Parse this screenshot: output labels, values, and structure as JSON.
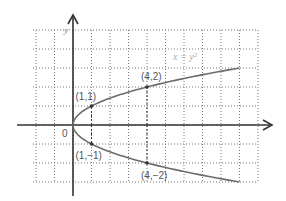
{
  "chart_data": {
    "type": "line",
    "title": "",
    "equation_label": "x = y²",
    "xlabel": "",
    "ylabel": "y",
    "origin_label": "0",
    "xlim": [
      -3,
      10
    ],
    "ylim": [
      -3,
      5
    ],
    "grid": true,
    "series": [
      {
        "name": "x = y²",
        "points": [
          [
            9,
            -3
          ],
          [
            4,
            -2
          ],
          [
            1,
            -1
          ],
          [
            0,
            0
          ],
          [
            1,
            1
          ],
          [
            4,
            2
          ],
          [
            9,
            3
          ]
        ]
      }
    ],
    "annotations": [
      {
        "label": "(1,1)",
        "x": 1,
        "y": 1
      },
      {
        "label": "(4,2)",
        "x": 4,
        "y": 2
      },
      {
        "label": "(1,−1)",
        "x": 1,
        "y": -1
      },
      {
        "label": "(4,−2)",
        "x": 4,
        "y": -2
      }
    ]
  },
  "layout": {
    "origin_px": [
      73,
      125
    ],
    "unit_x_px": 18.5,
    "unit_y_px": 19,
    "grid_left_px": 33,
    "grid_right_px": 258,
    "grid_top_px": 30,
    "grid_bottom_px": 182,
    "curve_color": "#6b6b6b",
    "axis_color": "#333333",
    "grid_color": "#777777"
  }
}
